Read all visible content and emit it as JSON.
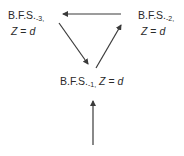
{
  "diagram": {
    "nodes": [
      {
        "id": "bfs3",
        "base": "B.F.S.",
        "sub": "-3,",
        "line2_var": "Z",
        "line2_eq": " = ",
        "line2_val": "d"
      },
      {
        "id": "bfs2",
        "base": "B.F.S.",
        "sub": "-2,",
        "line2_var": "Z",
        "line2_eq": " = ",
        "line2_val": "d"
      },
      {
        "id": "bfs1",
        "base": "B.F.S.",
        "sub": "-1,",
        "var": "Z",
        "eq": " = ",
        "val": "d"
      }
    ],
    "edges": [
      {
        "from": "bfs2",
        "to": "bfs3"
      },
      {
        "from": "bfs3",
        "to": "bfs1"
      },
      {
        "from": "bfs1",
        "to": "bfs2"
      },
      {
        "from": "entry",
        "to": "bfs1"
      }
    ],
    "colors": {
      "arrow": "#3a3a3a",
      "text": "#2a2a2a"
    }
  }
}
